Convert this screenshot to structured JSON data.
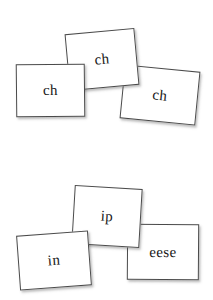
{
  "page": {
    "background_color": "#ffffff"
  },
  "style": {
    "card_fill": "#ffffff",
    "card_border_color": "#4a4a4a",
    "card_shadow_color": "#5a5a5a",
    "text_color": "#171717"
  },
  "groups": [
    {
      "name": "top-group",
      "cards": [
        {
          "label": "ch",
          "position": "left"
        },
        {
          "label": "ch",
          "position": "middle"
        },
        {
          "label": "ch",
          "position": "right"
        }
      ]
    },
    {
      "name": "bottom-group",
      "cards": [
        {
          "label": "in",
          "position": "left"
        },
        {
          "label": "ip",
          "position": "middle"
        },
        {
          "label": "eese",
          "position": "right"
        }
      ]
    }
  ]
}
